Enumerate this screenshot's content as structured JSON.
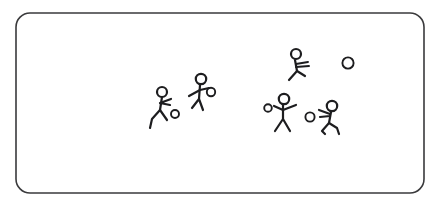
{
  "scene": {
    "title": "Stick figure soccer sketch",
    "background_color": "#ffffff",
    "ink_color": "#1d1d1f",
    "frame": {
      "name": "rounded-rectangle-border",
      "stroke_color": "#3a3a3c",
      "x": 16,
      "y": 13,
      "width": 408,
      "height": 180,
      "corner_radius": 14,
      "stroke_width": 1.6
    },
    "figures": [
      {
        "id": "figure-1",
        "label": "Stick figure running left with ball",
        "head_cx": 162,
        "head_cy": 92,
        "head_r": 5.0,
        "body": "M162,97 L160,110",
        "arms": "M160,103 L171,99 M160,103 L170,105",
        "legs": "M160,110 L152,119 L150,128 M160,110 L167,120",
        "ball": {
          "cx": 175,
          "cy": 114,
          "r": 4.0
        }
      },
      {
        "id": "figure-2",
        "label": "Stick figure kicking ball",
        "head_cx": 201,
        "head_cy": 79,
        "head_r": 5.2,
        "body": "M200,85 L199,99",
        "arms": "M200,90 L189,96 M200,90 L209,88",
        "legs": "M199,99 L192,108 M199,99 L203,110",
        "ball": {
          "cx": 211,
          "cy": 92,
          "r": 4.2
        }
      },
      {
        "id": "figure-3",
        "label": "Stick figure with motion lines upper right",
        "head_cx": 296,
        "head_cy": 54,
        "head_r": 5.0,
        "body": "M295,60 L297,71",
        "arms": "M296,64 L308,62 M296,67 L309,66",
        "legs": "M297,71 L289,80 M297,71 L305,76",
        "ball": null
      },
      {
        "id": "figure-4",
        "label": "Stick figure arms outstretched with ball",
        "head_cx": 284,
        "head_cy": 99,
        "head_r": 5.2,
        "body": "M283,105 L283,119",
        "arms": "M283,110 L274,106 M283,110 L296,105",
        "legs": "M283,119 L275,131 M283,119 L290,131",
        "ball": {
          "cx": 268,
          "cy": 108,
          "r": 3.8
        }
      },
      {
        "id": "figure-5",
        "label": "Stick figure leaning right with ball",
        "head_cx": 332,
        "head_cy": 106,
        "head_r": 5.2,
        "body": "M331,112 L329,123",
        "arms": "M330,114 L319,110 M330,116 L320,117",
        "legs": "M329,123 L322,131 L325,134 M329,123 L337,128 L339,134",
        "ball": {
          "cx": 310,
          "cy": 117,
          "r": 4.6
        }
      }
    ],
    "loose_balls": [
      {
        "id": "ball-free-1",
        "label": "Ball in air upper right",
        "cx": 348,
        "cy": 63,
        "r": 5.6
      }
    ]
  }
}
